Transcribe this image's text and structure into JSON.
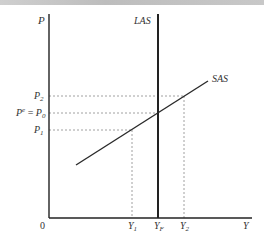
{
  "diagram": {
    "type": "AS model (LAS / SAS)",
    "axes": {
      "y_label": "P",
      "x_label": "Y",
      "origin_label": "0"
    },
    "curves": [
      {
        "name": "LAS",
        "label": "LAS",
        "kind": "vertical",
        "at": "Y_F"
      },
      {
        "name": "SAS",
        "label": "SAS",
        "kind": "upward-sloping"
      }
    ],
    "price_levels": [
      {
        "id": "P2",
        "base": "P",
        "sub": "2"
      },
      {
        "id": "P0",
        "prefix": "P",
        "prefix_sup": "e",
        "eq": " = ",
        "base": "P",
        "sub": "0"
      },
      {
        "id": "P1",
        "base": "P",
        "sub": "1"
      }
    ],
    "output_levels": [
      {
        "id": "Y1",
        "base": "Y",
        "sub": "1"
      },
      {
        "id": "YF",
        "base": "Y",
        "sub": "F"
      },
      {
        "id": "Y2",
        "base": "Y",
        "sub": "2"
      }
    ],
    "colors": {
      "axis": "#222222",
      "curve": "#2a2a2a",
      "dashed": "#888888",
      "text": "#333333"
    }
  }
}
